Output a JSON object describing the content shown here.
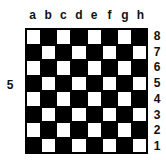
{
  "files": [
    "a",
    "b",
    "c",
    "d",
    "e",
    "f",
    "g",
    "h"
  ],
  "ranks": [
    "8",
    "7",
    "6",
    "5",
    "4",
    "3",
    "2",
    "1"
  ],
  "side_label": "5",
  "board": {
    "top_left_square": "light",
    "light_color": "#ffffff",
    "dark_color": "#000000",
    "size": 8
  }
}
